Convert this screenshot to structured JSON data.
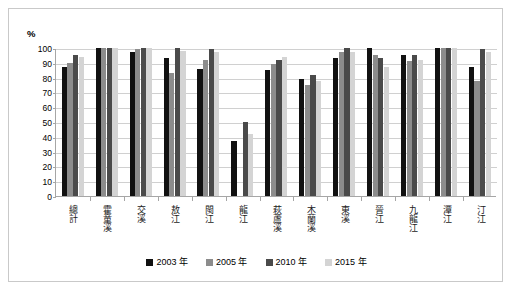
{
  "chart_data": {
    "type": "bar",
    "title": "",
    "subtitle": "",
    "xlabel": "",
    "ylabel": "%",
    "ylim": [
      0,
      100
    ],
    "ytick_step": 10,
    "yticks": [
      0,
      10,
      20,
      30,
      40,
      50,
      60,
      70,
      80,
      90,
      100
    ],
    "grid": true,
    "legend_position": "bottom",
    "categories": [
      "總計",
      "霍童溪",
      "交溪",
      "敖江",
      "閩江",
      "龍江",
      "萩蘆溪",
      "木蘭溪",
      "東溪",
      "晉江",
      "九龍江",
      "潭江",
      "汀江"
    ],
    "series": [
      {
        "name": "2003 年",
        "color": "#111111",
        "values": [
          87,
          100,
          97,
          93,
          85.5,
          37,
          85,
          79,
          93,
          100,
          95,
          100,
          87
        ]
      },
      {
        "name": "2005 年",
        "color": "#8c8c8c",
        "values": [
          90,
          100,
          99,
          83,
          92,
          0,
          89,
          75,
          97,
          95,
          91,
          100,
          78
        ]
      },
      {
        "name": "2010 年",
        "color": "#4a4a4a",
        "values": [
          95.5,
          100,
          100,
          100,
          99,
          50,
          92,
          82,
          100,
          93,
          95,
          100,
          99
        ]
      },
      {
        "name": "2015 年",
        "color": "#d4d4d4",
        "values": [
          94,
          100,
          100,
          98,
          97.5,
          42,
          94,
          78,
          97,
          87,
          92,
          100,
          97
        ]
      }
    ]
  },
  "axis": {
    "unit_label": "%"
  },
  "colors": {
    "frame_border": "#c9c9c9",
    "axis_line": "#a6a6a6",
    "gridline": "#d0d0d0",
    "plot_background": "#ffffff"
  }
}
